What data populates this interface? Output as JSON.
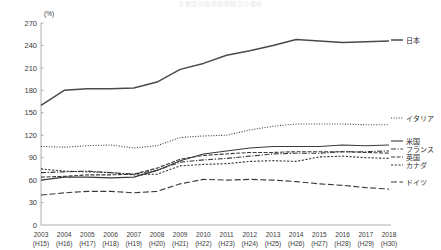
{
  "title": "主要国の政府債務残高の推移",
  "unit_label": "(%)",
  "axis": {
    "y_ticks": [
      0,
      30,
      60,
      90,
      120,
      150,
      180,
      210,
      240,
      270
    ],
    "y_min": 0,
    "y_max": 270,
    "x_labels": [
      "2003",
      "2004",
      "2005",
      "2006",
      "2007",
      "2008",
      "2009",
      "2010",
      "2011",
      "2012",
      "2013",
      "2014",
      "2015",
      "2016",
      "2017",
      "2018"
    ],
    "x_sub_labels": [
      "(H15)",
      "(H16)",
      "(H17)",
      "(H18)",
      "(H19)",
      "(H20)",
      "(H21)",
      "(H22)",
      "(H23)",
      "(H24)",
      "(H25)",
      "(H26)",
      "(H27)",
      "(H28)",
      "(H29)",
      "(H30)"
    ]
  },
  "chart_data": {
    "type": "line",
    "title": "主要国の政府債務残高の推移",
    "xlabel": "",
    "ylabel": "(%)",
    "ylim": [
      0,
      270
    ],
    "grid": false,
    "legend_position": "right",
    "categories": [
      "2003",
      "2004",
      "2005",
      "2006",
      "2007",
      "2008",
      "2009",
      "2010",
      "2011",
      "2012",
      "2013",
      "2014",
      "2015",
      "2016",
      "2017",
      "2018"
    ],
    "series": [
      {
        "name": "日本",
        "color": "#4a4a4a",
        "dash": "none",
        "width": 1.5,
        "legend_y": 40,
        "values": [
          160,
          180,
          182,
          182,
          183,
          191,
          208,
          216,
          227,
          233,
          240,
          248,
          246,
          244,
          245,
          246
        ]
      },
      {
        "name": "イタリア",
        "color": "#3a3a3a",
        "dash": "1,1.6",
        "width": 1.1,
        "legend_y": 118,
        "values": [
          105,
          104,
          106,
          107,
          103,
          106,
          117,
          119,
          120,
          127,
          132,
          135,
          135,
          135,
          134,
          134
        ]
      },
      {
        "name": "米国",
        "color": "#3a3a3a",
        "dash": "none",
        "width": 1.1,
        "legend_y": 141,
        "values": [
          60,
          64,
          64,
          63,
          64,
          73,
          86,
          95,
          99,
          103,
          105,
          105,
          105,
          107,
          106,
          107
        ]
      },
      {
        "name": "フランス",
        "color": "#3a3a3a",
        "dash": "5,1.6,1.2,1.6",
        "width": 1.1,
        "legend_y": 149,
        "values": [
          70,
          71,
          72,
          70,
          68,
          73,
          84,
          87,
          89,
          92,
          95,
          96,
          96,
          98,
          98,
          99
        ]
      },
      {
        "name": "英国",
        "color": "#3a3a3a",
        "dash": "4,1.5",
        "width": 1.1,
        "legend_y": 157,
        "values": [
          64,
          65,
          67,
          67,
          68,
          76,
          88,
          93,
          95,
          97,
          97,
          98,
          98,
          98,
          97,
          96
        ]
      },
      {
        "name": "カナダ",
        "color": "#3a3a3a",
        "dash": "2.2,1.5",
        "width": 1.1,
        "legend_y": 165,
        "values": [
          75,
          72,
          71,
          70,
          67,
          68,
          79,
          81,
          82,
          85,
          86,
          85,
          91,
          92,
          90,
          89
        ]
      },
      {
        "name": "ドイツ",
        "color": "#3a3a3a",
        "dash": "6,2.5",
        "width": 1.1,
        "legend_y": 182,
        "values": [
          40,
          43,
          45,
          45,
          43,
          45,
          55,
          61,
          60,
          61,
          60,
          58,
          55,
          53,
          50,
          48
        ]
      }
    ]
  },
  "colors": {
    "axis": "#9a9a9a",
    "text": "#3a3a3a",
    "japan": "#4a4a4a",
    "background": "#ffffff"
  }
}
